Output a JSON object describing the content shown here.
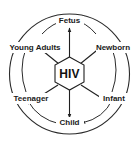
{
  "diagram": {
    "core": {
      "label": "HIV",
      "shape": "hexagon"
    },
    "stages": [
      {
        "id": "fetus",
        "label": "Fetus",
        "angle_deg": 270
      },
      {
        "id": "newborn",
        "label": "Newborn",
        "angle_deg": 326
      },
      {
        "id": "infant",
        "label": "Infant",
        "angle_deg": 36
      },
      {
        "id": "child",
        "label": "Child",
        "angle_deg": 90
      },
      {
        "id": "teenager",
        "label": "Teenager",
        "angle_deg": 146
      },
      {
        "id": "young-adults",
        "label": "Young Adults",
        "angle_deg": 214
      }
    ],
    "cycle_order": [
      "fetus",
      "newborn",
      "infant",
      "child",
      "teenager",
      "young-adults"
    ],
    "colors": {
      "background": "#ffffff",
      "stroke": "#2b2b2b",
      "text": "#1a1a1a"
    }
  }
}
